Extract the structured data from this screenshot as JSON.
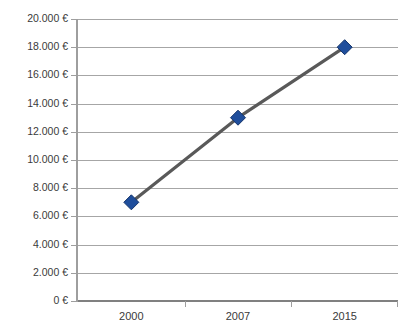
{
  "chart": {
    "title": "",
    "currency_symbol": "€",
    "line_color": "#595959",
    "marker_fill": "#1f4e9c",
    "marker_edge": "#15356b",
    "gridline_color": "#a6a6a6",
    "axis_color": "#808080",
    "background": "#ffffff"
  },
  "chart_data": {
    "type": "line",
    "title": "",
    "subtitle": "",
    "xlabel": "",
    "ylabel": "",
    "categories": [
      "2000",
      "2007",
      "2015"
    ],
    "x": [
      2000,
      2007,
      2015
    ],
    "values": [
      7000,
      13000,
      18000
    ],
    "value_labels": [
      "7.000 €",
      "13.000 €",
      "18.000 €"
    ],
    "series": [
      {
        "name": "",
        "values": [
          7000,
          13000,
          18000
        ],
        "marker": "diamond",
        "marker_color": "#1f4e9c",
        "line_color": "#595959"
      }
    ],
    "ylim": [
      0,
      20000
    ],
    "ytick_step": 2000,
    "yticks": [
      0,
      2000,
      4000,
      6000,
      8000,
      10000,
      12000,
      14000,
      16000,
      18000,
      20000
    ],
    "ytick_labels": [
      "0 €",
      "2.000 €",
      "4.000 €",
      "6.000 €",
      "8.000 €",
      "10.000 €",
      "12.000 €",
      "14.000 €",
      "16.000 €",
      "18.000 €",
      "20.000 €"
    ],
    "xtick_labels": [
      "2000",
      "2007",
      "2015"
    ],
    "grid": {
      "horizontal": true,
      "vertical": false
    },
    "legend": {
      "visible": false,
      "position": "none"
    },
    "annotations": []
  }
}
